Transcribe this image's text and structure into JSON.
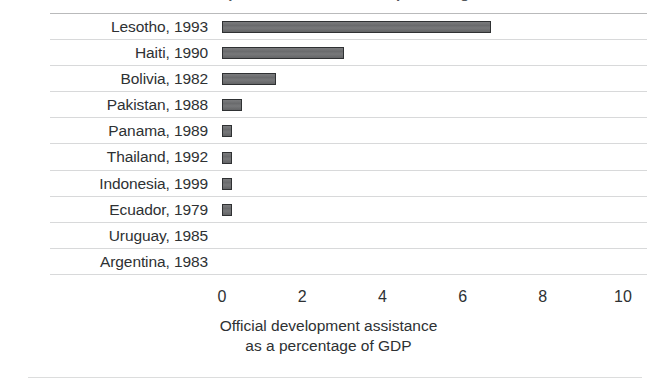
{
  "figure": {
    "cropped_title_fragment": "Official development assistance as a percentage of GDP",
    "background_color": "#ffffff",
    "bar_color": "#6d6e70",
    "bar_border_color": "#2f3133",
    "gridline_color": "#d8d9da",
    "text_color": "#2e3133"
  },
  "chart_data": {
    "type": "bar",
    "orientation": "horizontal",
    "title": "",
    "xlabel_line1": "Official development assistance",
    "xlabel_line2": "as a percentage of GDP",
    "ylabel": "",
    "categories": [
      "Lesotho, 1993",
      "Haiti, 1990",
      "Bolivia, 1982",
      "Pakistan, 1988",
      "Panama, 1989",
      "Thailand, 1992",
      "Indonesia, 1999",
      "Ecuador, 1979",
      "Uruguay, 1985",
      "Argentina, 1983"
    ],
    "values": [
      6.7,
      3.05,
      1.35,
      0.5,
      0.25,
      0.25,
      0.25,
      0.25,
      0.0,
      0.0
    ],
    "xlim": [
      0,
      10
    ],
    "xticks": [
      0,
      2,
      4,
      6,
      8,
      10
    ],
    "xtick_labels": [
      "0",
      "2",
      "4",
      "6",
      "8",
      "10"
    ],
    "grid": true,
    "grid_axis": "y",
    "legend": false
  }
}
